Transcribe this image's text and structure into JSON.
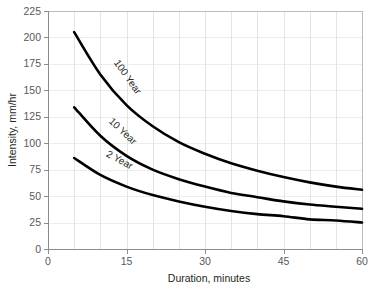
{
  "chart_data": {
    "type": "line",
    "title": "",
    "subtitle": "",
    "xlabel": "Duration, minutes",
    "ylabel": "Intensity, mm/hr",
    "xlim": [
      0,
      60
    ],
    "ylim": [
      0,
      225
    ],
    "xticks": [
      0,
      15,
      30,
      45,
      60
    ],
    "yticks": [
      0,
      25,
      50,
      75,
      100,
      125,
      150,
      175,
      200,
      225
    ],
    "xtick_labels": [
      "0",
      "15",
      "30",
      "45",
      "60"
    ],
    "ytick_labels": [
      "0",
      "25",
      "50",
      "75",
      "100",
      "125",
      "150",
      "175",
      "200",
      "225"
    ],
    "grid": true,
    "grid_x_interval": 5,
    "grid_y_interval": 25,
    "legend": "inline-curve-labels",
    "legend_position": "on-curve",
    "line_color": "#000000",
    "grid_color": "#d9d9d9",
    "axis_color": "#8c8c8c",
    "x": [
      5,
      10,
      15,
      20,
      25,
      30,
      35,
      40,
      45,
      50,
      55,
      60
    ],
    "series": [
      {
        "name": "100 Year",
        "label": "100 Year",
        "label_x": 12.5,
        "label_y": 176,
        "values": [
          205,
          165,
          136,
          116,
          101,
          90,
          81,
          74,
          68,
          63,
          59,
          56
        ]
      },
      {
        "name": "10 Year",
        "label": "10 Year",
        "label_x": 11.5,
        "label_y": 120,
        "values": [
          134,
          107,
          88,
          75,
          66,
          59,
          53,
          49,
          45,
          42,
          40,
          38
        ]
      },
      {
        "name": "2 Year",
        "label": "2 Year",
        "label_x": 11.0,
        "label_y": 88,
        "values": [
          86,
          70,
          59,
          51,
          45,
          40,
          36,
          33,
          31,
          28,
          27,
          25
        ]
      }
    ]
  }
}
